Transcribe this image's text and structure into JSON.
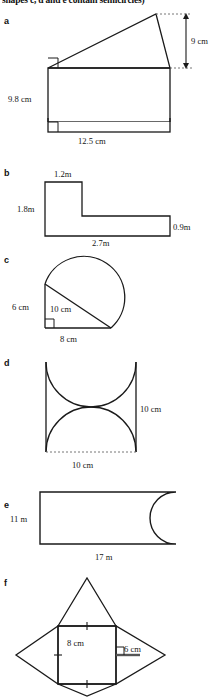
{
  "page": {
    "instruction": "shapes c, d and e contain semicircles)",
    "background": "#ffffff",
    "ink": "#1a1a1a"
  },
  "parts": [
    {
      "id": "a",
      "label": "a",
      "shape": "triangle-on-rectangle",
      "dimensions": [
        {
          "name": "height-of-triangle",
          "text": "9 cm"
        },
        {
          "name": "rectangle-height",
          "text": "9.8 cm"
        },
        {
          "name": "rectangle-width",
          "text": "12.5 cm"
        }
      ],
      "right_angle_markers": 2
    },
    {
      "id": "b",
      "label": "b",
      "shape": "l-shape",
      "dimensions": [
        {
          "name": "top-width",
          "text": "1.2m"
        },
        {
          "name": "left-height",
          "text": "1.8m"
        },
        {
          "name": "right-height",
          "text": "0.9m"
        },
        {
          "name": "bottom-width",
          "text": "2.7m"
        }
      ],
      "right_angle_markers": 0
    },
    {
      "id": "c",
      "label": "c",
      "shape": "sector-with-right-triangle",
      "dimensions": [
        {
          "name": "vertical-side",
          "text": "6 cm"
        },
        {
          "name": "hypotenuse",
          "text": "10 cm"
        },
        {
          "name": "horizontal-side",
          "text": "8 cm"
        }
      ],
      "right_angle_markers": 1
    },
    {
      "id": "d",
      "label": "d",
      "shape": "square-with-two-semicircles-removed",
      "dimensions": [
        {
          "name": "right-side",
          "text": "10 cm"
        },
        {
          "name": "bottom-side",
          "text": "10 cm"
        }
      ],
      "right_angle_markers": 0
    },
    {
      "id": "e",
      "label": "e",
      "shape": "rectangle-with-semicircle-removed",
      "dimensions": [
        {
          "name": "left-side",
          "text": "11 m"
        },
        {
          "name": "bottom-side",
          "text": "17 m"
        }
      ],
      "right_angle_markers": 0
    },
    {
      "id": "f",
      "label": "f",
      "shape": "square-with-four-triangles",
      "dimensions": [
        {
          "name": "square-side",
          "text": "8 cm"
        },
        {
          "name": "triangle-height",
          "text": "6 cm"
        }
      ],
      "right_angle_markers": 1
    }
  ]
}
